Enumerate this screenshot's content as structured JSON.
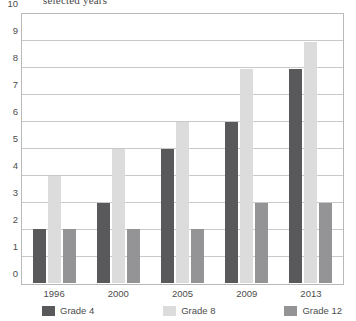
{
  "subtitle": "selected years",
  "chart_data": {
    "type": "bar",
    "title": "selected years",
    "xlabel": "",
    "ylabel": "",
    "ylim": [
      0,
      10
    ],
    "yticks": [
      10,
      9,
      8,
      7,
      6,
      5,
      4,
      3,
      2,
      1,
      0
    ],
    "grid": true,
    "legend_position": "bottom",
    "categories": [
      "1996",
      "2000",
      "2005",
      "2009",
      "2013"
    ],
    "series": [
      {
        "name": "Grade 4",
        "color": "#59595b",
        "values": [
          2,
          3,
          5,
          6,
          8
        ]
      },
      {
        "name": "Grade 8",
        "color": "#dcdcdc",
        "values": [
          4,
          5,
          6,
          8,
          9
        ]
      },
      {
        "name": "Grade 12",
        "color": "#949497",
        "values": [
          2,
          2,
          2,
          3,
          3
        ]
      }
    ]
  }
}
